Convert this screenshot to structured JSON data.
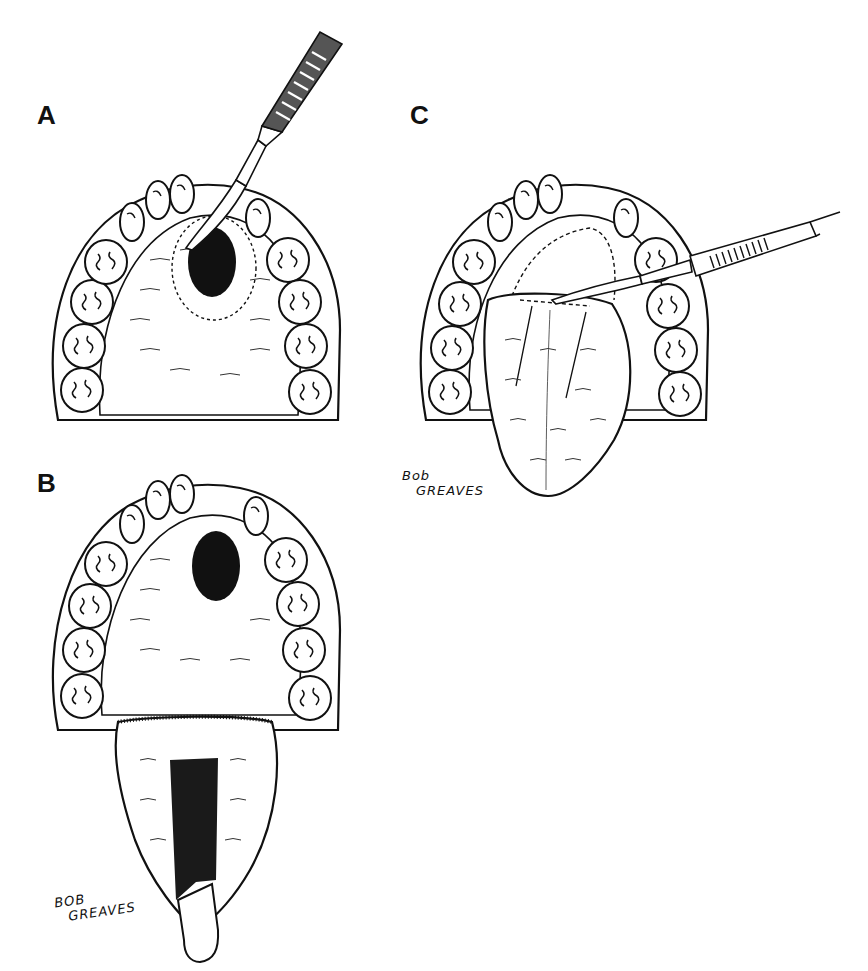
{
  "figure": {
    "panels": [
      {
        "id": "A",
        "label": "A",
        "description": "Palate with oronasal fistula; scalpel outlining dotted incision around defect"
      },
      {
        "id": "B",
        "label": "B",
        "description": "Palate with fistula; tongue flap raised from dorsum of tongue"
      },
      {
        "id": "C",
        "label": "C",
        "description": "Tongue flap sutured over palatal defect; scalpel dividing flap pedicle"
      }
    ],
    "signatures": [
      {
        "panel": "B",
        "line1": "BOB",
        "line2": "GREAVES"
      },
      {
        "panel": "C",
        "line1": "Bob",
        "line2": "GREAVES"
      }
    ],
    "colors": {
      "ink": "#111111",
      "background": "#ffffff"
    }
  }
}
